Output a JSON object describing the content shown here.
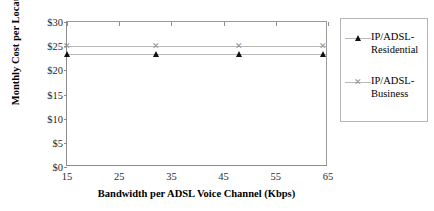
{
  "chart_data": {
    "type": "scatter",
    "title": "",
    "xlabel": "Bandwidth per ADSL Voice Channel (Kbps)",
    "ylabel": "Monthly Cost per Location",
    "xlim": [
      15,
      65
    ],
    "ylim": [
      0,
      30
    ],
    "xticks": [
      15,
      25,
      35,
      45,
      55,
      65
    ],
    "xticklabels": [
      "15",
      "25",
      "35",
      "45",
      "55",
      "65"
    ],
    "yticks": [
      0,
      5,
      10,
      15,
      20,
      25,
      30
    ],
    "yticklabels": [
      "$0",
      "$5",
      "$10",
      "$15",
      "$20",
      "$25",
      "$30"
    ],
    "grid": false,
    "legend_position": "right",
    "x": [
      15,
      32,
      48,
      64
    ],
    "series": [
      {
        "name": "IP/ADSL-Residential",
        "marker": "triangle",
        "color": "#111111",
        "values": [
          23.3,
          23.3,
          23.3,
          23.3
        ]
      },
      {
        "name": "IP/ADSL-Business",
        "marker": "x",
        "color": "#8f8f8f",
        "values": [
          25.0,
          25.0,
          25.0,
          25.0
        ]
      }
    ]
  },
  "legend": {
    "entries": [
      {
        "label": "IP/ADSL-Residential",
        "symbol": "▲"
      },
      {
        "label": "IP/ADSL-Business",
        "symbol": "✕"
      }
    ]
  }
}
